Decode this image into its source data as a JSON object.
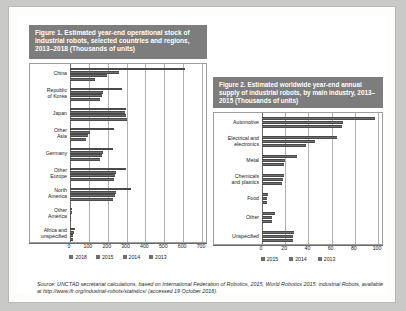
{
  "document": {
    "source_note": "Source: UNCTAD secretariat calculations, based on International Federation of Robotics, 2015, World Robotics 2015: industrial Robots, available at http://www.ifr.org/industrial-robots/statistics/ (accessed 19 October 2016)."
  },
  "figure1": {
    "title": "Figure 1. Estimated year-end operational stock of industrial robots, selected countries and regions, 2013–2018 (Thousands of units)",
    "legend": [
      "2018",
      "2015",
      "2014",
      "2013"
    ],
    "chart_data": {
      "type": "bar",
      "orientation": "horizontal",
      "title": "Figure 1. Estimated year-end operational stock of industrial robots, selected countries and regions, 2013–2018 (Thousands of units)",
      "xlabel": "",
      "ylabel": "",
      "xlim": [
        0,
        700
      ],
      "xticks": [
        0,
        100,
        200,
        300,
        400,
        500,
        600,
        700
      ],
      "grid": true,
      "legend_position": "bottom",
      "categories": [
        "China",
        "Republic\nof Korea",
        "Japan",
        "Other\nAsia",
        "Germany",
        "Other\nEurope",
        "North\nAmerica",
        "Other\nAmerica",
        "Africa and\nunspecified"
      ],
      "series": [
        {
          "name": "2018",
          "values": [
            612,
            277,
            297,
            232,
            228,
            297,
            322,
            12,
            27
          ]
        },
        {
          "name": "2015",
          "values": [
            260,
            175,
            290,
            105,
            175,
            245,
            243,
            9,
            20
          ]
        },
        {
          "name": "2014",
          "values": [
            196,
            170,
            295,
            93,
            168,
            240,
            236,
            7,
            17
          ]
        },
        {
          "name": "2013",
          "values": [
            132,
            160,
            300,
            83,
            160,
            235,
            228,
            6,
            14
          ]
        }
      ]
    }
  },
  "figure2": {
    "title": "Figure 2. Estimated worldwide year-end annual supply of industrial robots, by main industry, 2013–2015 (Thousands of units)",
    "legend": [
      "2015",
      "2014",
      "2013"
    ],
    "chart_data": {
      "type": "bar",
      "orientation": "horizontal",
      "title": "Figure 2. Estimated worldwide year-end annual supply of industrial robots, by main industry, 2013–2015 (Thousands of units)",
      "xlabel": "",
      "ylabel": "",
      "xlim": [
        0,
        100
      ],
      "xticks": [
        0,
        20,
        40,
        60,
        80,
        100
      ],
      "grid": true,
      "legend_position": "bottom",
      "categories": [
        "Automotive",
        "Electrical and\nelectronics",
        "Metal",
        "Chemicals\nand plastics",
        "Food",
        "Other",
        "Unspecified"
      ],
      "series": [
        {
          "name": "2015",
          "values": [
            97,
            65,
            30,
            19,
            5,
            11,
            28
          ]
        },
        {
          "name": "2014",
          "values": [
            70,
            46,
            20,
            18,
            4,
            9,
            27
          ]
        },
        {
          "name": "2013",
          "values": [
            69,
            38,
            19,
            17,
            4,
            9,
            27
          ]
        }
      ]
    }
  }
}
